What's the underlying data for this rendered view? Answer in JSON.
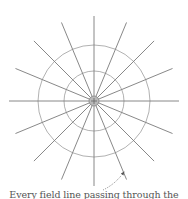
{
  "figure": {
    "caption": "Every field line passing through the",
    "top_text_fragment": "",
    "charge": {
      "sign": "+",
      "center": [
        94,
        101
      ],
      "radius": 5,
      "fill": "#b8b8b8",
      "stroke": "#888888"
    },
    "field_lines": {
      "count": 16,
      "angle_step_deg": 22.5,
      "length": 85,
      "direction": "outward",
      "color": "#7a7a7a",
      "arrow_positions_from_center": [
        40,
        70
      ]
    },
    "rings": [
      {
        "name": "inner-sphere",
        "radius": 30,
        "color": "#a8a8a8"
      },
      {
        "name": "outer-sphere",
        "radius": 56,
        "color": "#a8a8a8"
      }
    ],
    "pointer": {
      "style": "dotted",
      "from": [
        103,
        190
      ],
      "to": [
        124,
        172
      ],
      "color": "#666666"
    }
  }
}
